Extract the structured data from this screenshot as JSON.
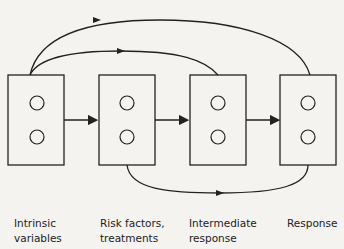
{
  "diagram": {
    "nodes": [
      {
        "id": "intrinsic",
        "label": "Intrinsic\nvariables",
        "circles": 2
      },
      {
        "id": "risk",
        "label": "Risk factors,\ntreatments",
        "circles": 2
      },
      {
        "id": "intermediate",
        "label": "Intermediate\nresponse",
        "circles": 2
      },
      {
        "id": "response",
        "label": "Response",
        "circles": 2
      }
    ],
    "edges": [
      {
        "from": "intrinsic",
        "to": "risk",
        "style": "straight"
      },
      {
        "from": "risk",
        "to": "intermediate",
        "style": "straight"
      },
      {
        "from": "intermediate",
        "to": "response",
        "style": "straight"
      },
      {
        "from": "intrinsic",
        "to": "intermediate",
        "style": "curve-above-inner"
      },
      {
        "from": "intrinsic",
        "to": "response",
        "style": "curve-above-outer"
      },
      {
        "from": "risk",
        "to": "response",
        "style": "curve-below"
      }
    ],
    "colors": {
      "stroke": "#222222",
      "background": "#f4f3f0"
    }
  }
}
